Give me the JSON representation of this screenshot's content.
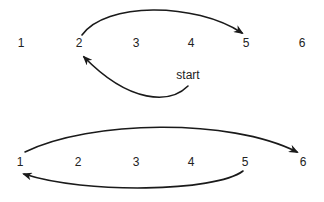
{
  "diagram": {
    "top": {
      "positions": [
        "1",
        "2",
        "3",
        "4",
        "5",
        "6"
      ],
      "start_label": "start",
      "arrows": [
        {
          "from": "start",
          "to": "2",
          "direction": "curves down then up to position 2"
        },
        {
          "from": "2",
          "to": "5",
          "direction": "arches over positions 3 and 4"
        }
      ]
    },
    "bottom": {
      "positions": [
        "1",
        "2",
        "3",
        "4",
        "5",
        "6"
      ],
      "arrows": [
        {
          "from": "1",
          "to": "6",
          "direction": "arches above all positions"
        },
        {
          "from": "5",
          "to": "1",
          "direction": "curves below positions 4 to 2"
        }
      ]
    },
    "colors": {
      "stroke": "#1a1a1a",
      "text": "#222222",
      "background": "#ffffff"
    }
  }
}
